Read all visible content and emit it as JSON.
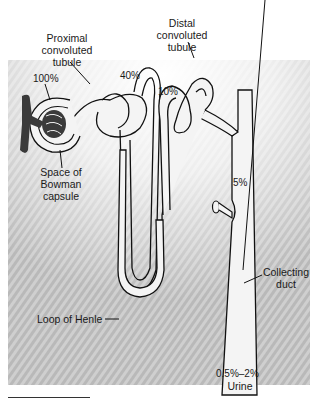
{
  "figure": {
    "type": "nephron-diagram",
    "colors": {
      "background_shade": "#c9c9c9",
      "tubule_fill": "#f4f4f4",
      "outline": "#111111",
      "glomerulus": "#3a3a3a"
    }
  },
  "labels": {
    "proximal": [
      "Proximal",
      "convoluted",
      "tubule"
    ],
    "distal": [
      "Distal",
      "convoluted",
      "tubule"
    ],
    "bowman": [
      "Space of",
      "Bowman",
      "capsule"
    ],
    "loop": "Loop of Henle",
    "collecting": [
      "Collecting",
      "duct"
    ],
    "urine": "Urine"
  },
  "percentages": {
    "glomerular_filtrate": "100%",
    "end_proximal": "40%",
    "start_distal": "10%",
    "collecting_duct": "5%",
    "urine": "0.5%–2%"
  }
}
